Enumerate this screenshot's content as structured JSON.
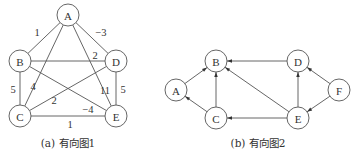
{
  "graph1": {
    "caption": "(a) 有向图1",
    "caption_pos": [
      68,
      143
    ],
    "node_radius": 11,
    "nodes": [
      {
        "id": "A",
        "label": "A",
        "x": 68,
        "y": 15
      },
      {
        "id": "B",
        "label": "B",
        "x": 20,
        "y": 61
      },
      {
        "id": "D",
        "label": "D",
        "x": 116,
        "y": 61
      },
      {
        "id": "C",
        "label": "C",
        "x": 20,
        "y": 116
      },
      {
        "id": "E",
        "label": "E",
        "x": 116,
        "y": 116
      }
    ],
    "edges": [
      {
        "from": "A",
        "to": "B",
        "weight": "1",
        "label_pos": [
          37,
          32
        ]
      },
      {
        "from": "A",
        "to": "D",
        "weight": "−3",
        "label_pos": [
          101,
          32
        ]
      },
      {
        "from": "A",
        "to": "C",
        "weight": "4",
        "label_pos": [
          33,
          86
        ]
      },
      {
        "from": "A",
        "to": "E",
        "weight": "11",
        "label_pos": [
          105,
          90
        ]
      },
      {
        "from": "B",
        "to": "D",
        "weight": "2",
        "label_pos": [
          95,
          55
        ]
      },
      {
        "from": "B",
        "to": "E",
        "weight": "−4",
        "label_pos": [
          88,
          109
        ]
      },
      {
        "from": "C",
        "to": "D",
        "weight": "2",
        "label_pos": [
          54,
          100
        ]
      },
      {
        "from": "B",
        "to": "C",
        "weight": "5",
        "label_pos": [
          13,
          89
        ]
      },
      {
        "from": "D",
        "to": "E",
        "weight": "5",
        "label_pos": [
          123,
          89
        ]
      },
      {
        "from": "C",
        "to": "E",
        "weight": "1",
        "label_pos": [
          70,
          124
        ]
      }
    ]
  },
  "graph2": {
    "caption": "(b) 有向图2",
    "caption_pos": [
      258,
      143
    ],
    "node_radius": 11,
    "nodes": [
      {
        "id": "A",
        "label": "A",
        "x": 176,
        "y": 90
      },
      {
        "id": "B",
        "label": "B",
        "x": 216,
        "y": 61
      },
      {
        "id": "C",
        "label": "C",
        "x": 216,
        "y": 118
      },
      {
        "id": "D",
        "label": "D",
        "x": 298,
        "y": 61
      },
      {
        "id": "E",
        "label": "E",
        "x": 298,
        "y": 118
      },
      {
        "id": "F",
        "label": "F",
        "x": 339,
        "y": 90
      }
    ],
    "edges": [
      {
        "from": "A",
        "to": "B"
      },
      {
        "from": "C",
        "to": "A"
      },
      {
        "from": "C",
        "to": "B"
      },
      {
        "from": "D",
        "to": "B"
      },
      {
        "from": "E",
        "to": "B"
      },
      {
        "from": "E",
        "to": "C"
      },
      {
        "from": "E",
        "to": "D"
      },
      {
        "from": "F",
        "to": "D"
      },
      {
        "from": "F",
        "to": "E"
      }
    ]
  },
  "colors": {
    "stroke": "#555555",
    "text": "#333333",
    "background": "#ffffff"
  }
}
